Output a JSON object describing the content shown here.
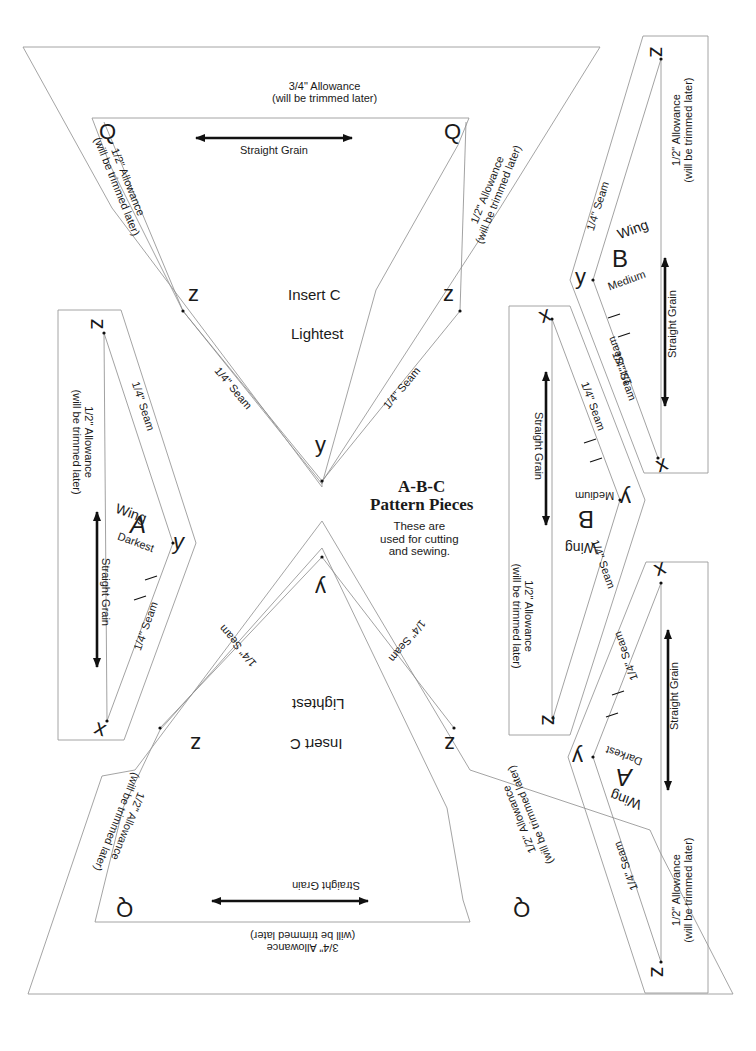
{
  "title_block": {
    "heading_line1": "A-B-C",
    "heading_line2": "Pattern Pieces",
    "note_line1": "These are",
    "note_line2": "used for cutting",
    "note_line3": "and sewing."
  },
  "labels": {
    "allowance_34": "3/4\" Allowance",
    "allowance_12": "1/2\" Allowance",
    "trimmed": "(will be trimmed later)",
    "straight_grain": "Straight Grain",
    "seam_14": "1/4\" Seam"
  },
  "insert_c": {
    "name": "Insert  C",
    "shade": "Lightest",
    "corner_q": "Q",
    "corner_z": "z",
    "corner_y": "y"
  },
  "wing_a": {
    "word": "Wing",
    "letter": "A",
    "shade": "Darkest",
    "corner_z": "z",
    "corner_y": "y",
    "corner_x": "x"
  },
  "wing_b": {
    "word": "Wing",
    "letter": "B",
    "shade": "Medium",
    "corner_z": "z",
    "corner_y": "y",
    "corner_x": "x"
  },
  "colors": {
    "outline": "#9a9a9a",
    "ink": "#111111",
    "paper": "#ffffff"
  }
}
